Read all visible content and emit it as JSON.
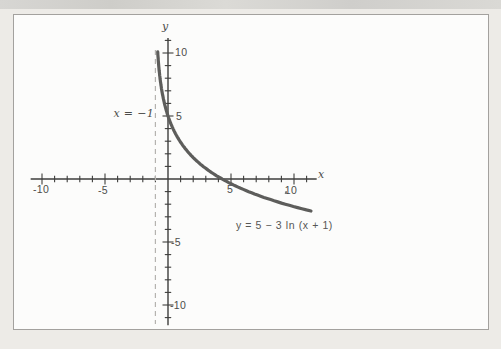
{
  "figure": {
    "kind": "scanned textbook graph",
    "background_color": "#edebe7",
    "frame_background": "#fcfcfb",
    "frame_border_color": "#a3a19e"
  },
  "chart_data": {
    "type": "line",
    "title": "",
    "equation_label": "y = 5 − 3 ln (x + 1)",
    "function": {
      "form": "y = a − b·ln(x + c)",
      "a": 5,
      "b": 3,
      "c": 1
    },
    "domain": [
      -0.817,
      11.35
    ],
    "key_points": [
      {
        "x": 0,
        "y": 5
      },
      {
        "x": 4.29,
        "y": 0
      },
      {
        "x": 11.3,
        "y": -2.54
      }
    ],
    "asymptote": {
      "x": -1,
      "label": "x = −1",
      "style": "dashed"
    },
    "x_axis": {
      "label": "x",
      "range": [
        -10.9,
        11.8
      ],
      "minor_tick_step": 1,
      "tick_values": [
        -10,
        -5,
        5,
        10
      ],
      "tick_labels": [
        "-10",
        "-5",
        "5",
        "10"
      ]
    },
    "y_axis": {
      "label": "y",
      "range": [
        -11.6,
        11.2
      ],
      "minor_tick_step": 1,
      "tick_values": [
        10,
        5,
        -5,
        -10
      ],
      "tick_labels": [
        "10",
        "5",
        "-5",
        "-10"
      ]
    },
    "grid": false,
    "legend": "none",
    "colors": {
      "curve": "#5d5d5b",
      "axis": "#3e3e3c",
      "asymptote": "#b5b3af",
      "text": "#4c4c4a"
    }
  }
}
